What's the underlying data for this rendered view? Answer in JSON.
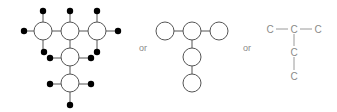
{
  "figure": {
    "separators": [
      "or",
      "or"
    ],
    "panel_ball_and_stick": {
      "carbons": [
        {
          "x": 43,
          "y": 31
        },
        {
          "x": 70,
          "y": 31
        },
        {
          "x": 97,
          "y": 31
        },
        {
          "x": 70,
          "y": 57
        },
        {
          "x": 70,
          "y": 83
        }
      ],
      "hydrogens": [
        {
          "x": 43,
          "y": 11
        },
        {
          "x": 70,
          "y": 11
        },
        {
          "x": 97,
          "y": 11
        },
        {
          "x": 24,
          "y": 31
        },
        {
          "x": 118,
          "y": 31
        },
        {
          "x": 44,
          "y": 52
        },
        {
          "x": 97,
          "y": 52
        },
        {
          "x": 50,
          "y": 58
        },
        {
          "x": 91,
          "y": 58
        },
        {
          "x": 50,
          "y": 84
        },
        {
          "x": 91,
          "y": 84
        },
        {
          "x": 70,
          "y": 105
        }
      ]
    },
    "panel_skeleton_circles": {
      "carbons": [
        {
          "x": 165,
          "y": 31
        },
        {
          "x": 192,
          "y": 31
        },
        {
          "x": 219,
          "y": 31
        },
        {
          "x": 192,
          "y": 57
        },
        {
          "x": 192,
          "y": 83
        }
      ]
    },
    "panel_condensed": {
      "atom_label": "C",
      "atoms": [
        {
          "x": 270,
          "y": 29
        },
        {
          "x": 294,
          "y": 29
        },
        {
          "x": 318,
          "y": 29
        },
        {
          "x": 294,
          "y": 52
        },
        {
          "x": 294,
          "y": 76
        }
      ]
    }
  }
}
